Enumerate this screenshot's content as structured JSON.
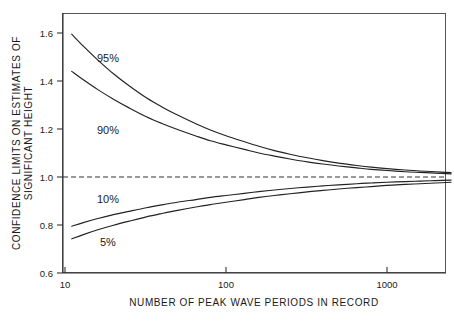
{
  "chart_data": {
    "type": "line",
    "title": "",
    "xlabel": "NUMBER OF PEAK WAVE PERIODS IN RECORD",
    "ylabel_line1": "CONFIDENCE LIMITS ON ESTIMATES OF",
    "ylabel_line2": "SIGNIFICANT HEIGHT",
    "xscale": "log",
    "xlim": [
      11,
      2600
    ],
    "ylim": [
      0.6,
      1.68
    ],
    "grid": false,
    "legend": "inline-curve-labels",
    "xticks": [
      10,
      100,
      1000
    ],
    "xtick_labels": [
      "10",
      "100",
      "1000"
    ],
    "yticks": [
      0.6,
      0.8,
      1.0,
      1.2,
      1.4,
      1.6
    ],
    "ytick_labels": [
      "0.6",
      "0.8",
      "1.0",
      "1.2",
      "1.4",
      "1.6"
    ],
    "reference_line": {
      "y": 1.0,
      "style": "dashed",
      "label": ""
    },
    "series": [
      {
        "name": "95%",
        "label": "95%",
        "x": [
          11,
          13,
          16,
          20,
          25,
          32,
          40,
          50,
          65,
          80,
          100,
          130,
          160,
          200,
          250,
          320,
          400,
          500,
          650,
          800,
          1000,
          1300,
          1600,
          2000,
          2500
        ],
        "values": [
          1.595,
          1.545,
          1.487,
          1.43,
          1.38,
          1.33,
          1.292,
          1.258,
          1.222,
          1.196,
          1.172,
          1.147,
          1.128,
          1.11,
          1.095,
          1.08,
          1.068,
          1.058,
          1.048,
          1.041,
          1.035,
          1.029,
          1.025,
          1.022,
          1.018
        ]
      },
      {
        "name": "90%",
        "label": "90%",
        "x": [
          11,
          13,
          16,
          20,
          25,
          32,
          40,
          50,
          65,
          80,
          100,
          130,
          160,
          200,
          250,
          320,
          400,
          500,
          650,
          800,
          1000,
          1300,
          1600,
          2000,
          2500
        ],
        "values": [
          1.44,
          1.405,
          1.364,
          1.324,
          1.288,
          1.251,
          1.223,
          1.198,
          1.171,
          1.151,
          1.134,
          1.115,
          1.1,
          1.087,
          1.075,
          1.063,
          1.054,
          1.046,
          1.038,
          1.032,
          1.027,
          1.022,
          1.019,
          1.016,
          1.013
        ]
      },
      {
        "name": "10%",
        "label": "10%",
        "x": [
          11,
          13,
          16,
          20,
          25,
          32,
          40,
          50,
          65,
          80,
          100,
          130,
          160,
          200,
          250,
          320,
          400,
          500,
          650,
          800,
          1000,
          1300,
          1600,
          2000,
          2500
        ],
        "values": [
          0.795,
          0.81,
          0.827,
          0.843,
          0.857,
          0.872,
          0.884,
          0.895,
          0.906,
          0.915,
          0.923,
          0.932,
          0.939,
          0.946,
          0.952,
          0.958,
          0.963,
          0.967,
          0.972,
          0.975,
          0.978,
          0.981,
          0.983,
          0.985,
          0.987
        ]
      },
      {
        "name": "5%",
        "label": "5%",
        "x": [
          11,
          13,
          16,
          20,
          25,
          32,
          40,
          50,
          65,
          80,
          100,
          130,
          160,
          200,
          250,
          320,
          400,
          500,
          650,
          800,
          1000,
          1300,
          1600,
          2000,
          2500
        ],
        "values": [
          0.742,
          0.76,
          0.78,
          0.799,
          0.816,
          0.834,
          0.848,
          0.861,
          0.875,
          0.885,
          0.895,
          0.906,
          0.915,
          0.923,
          0.93,
          0.938,
          0.944,
          0.95,
          0.956,
          0.96,
          0.965,
          0.969,
          0.972,
          0.975,
          0.978
        ]
      }
    ],
    "annotations": [
      {
        "text": "95%",
        "x_px": 97,
        "y_px": 62
      },
      {
        "text": "90%",
        "x_px": 97,
        "y_px": 134
      },
      {
        "text": "10%",
        "x_px": 97,
        "y_px": 203
      },
      {
        "text": "5%",
        "x_px": 100,
        "y_px": 246
      }
    ],
    "colors": {
      "curve": "#222222",
      "axis": "#333333",
      "frame": "#555555",
      "background": "#ffffff"
    }
  }
}
